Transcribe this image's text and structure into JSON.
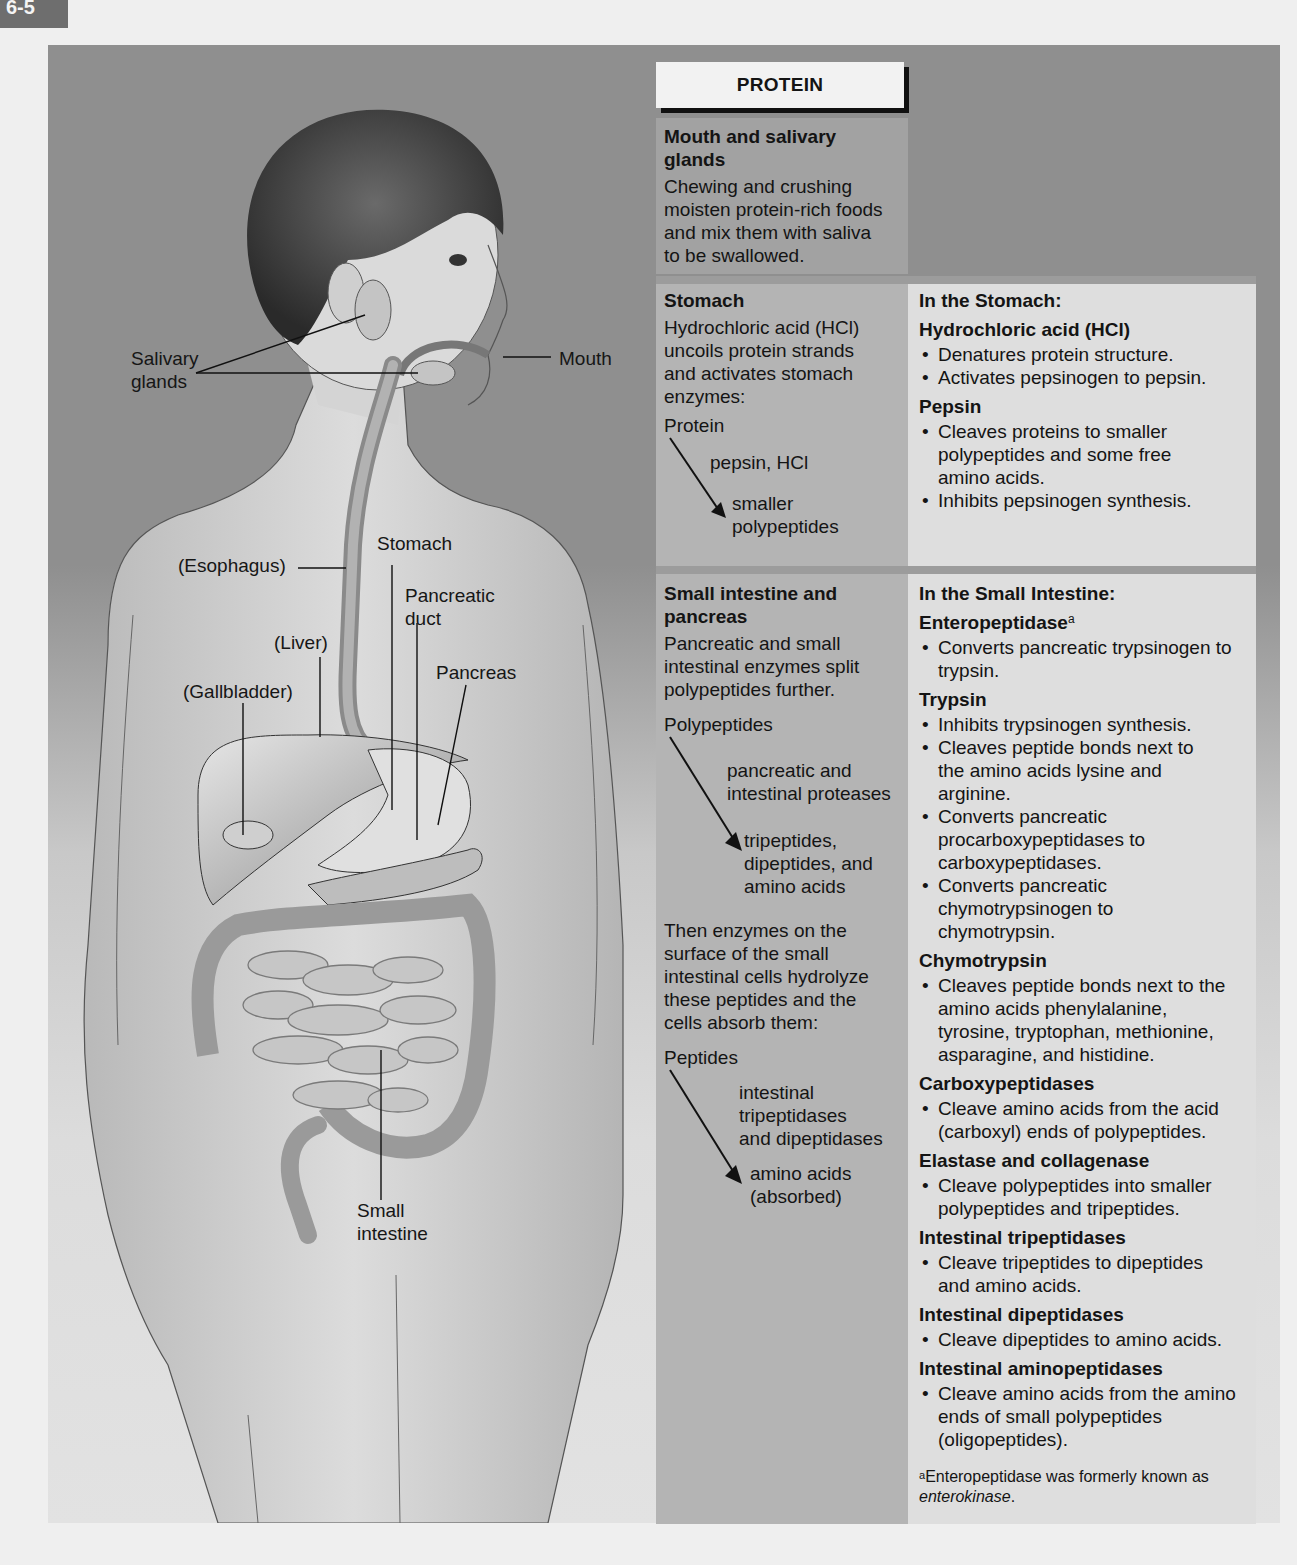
{
  "figure_tab": "6-5",
  "anatomy_labels": {
    "salivary_glands_1": "Salivary",
    "salivary_glands_2": "glands",
    "mouth": "Mouth",
    "esophagus": "(Esophagus)",
    "stomach": "Stomach",
    "pancreatic_duct_1": "Pancreatic",
    "pancreatic_duct_2": "duct",
    "liver": "(Liver)",
    "pancreas": "Pancreas",
    "gallbladder": "(Gallbladder)",
    "small_intestine_1": "Small",
    "small_intestine_2": "intestine"
  },
  "table": {
    "header": "PROTEIN",
    "mouth": {
      "title_1": "Mouth and salivary",
      "title_2": "glands",
      "text": "Chewing and crushing moisten protein-rich foods and mix them with saliva to be swallowed."
    },
    "stomach": {
      "title": "Stomach",
      "text": "Hydrochloric acid (HCl) uncoils protein strands and  activates stomach enzymes:",
      "flow": {
        "from": "Protein",
        "via": "pepsin, HCl",
        "to_1": "smaller",
        "to_2": "polypeptides"
      },
      "right_title": "In the Stomach:",
      "enzymes": [
        {
          "name": "Hydrochloric acid (HCl)",
          "bullets": [
            "Denatures protein structure.",
            "Activates pepsinogen to pepsin."
          ]
        },
        {
          "name": "Pepsin",
          "bullets": [
            "Cleaves proteins to smaller polypeptides and some free amino acids.",
            "Inhibits pepsinogen synthesis."
          ]
        }
      ]
    },
    "small_intestine": {
      "title_1": "Small intestine and",
      "title_2": "pancreas",
      "text": "Pancreatic and small intestinal enzymes split polypeptides further.",
      "flow1": {
        "from": "Polypeptides",
        "via_1": "pancreatic and",
        "via_2": "intestinal proteases",
        "to_1": "tripeptides,",
        "to_2": "dipeptides, and",
        "to_3": "amino acids"
      },
      "text2": "Then enzymes on the surface of the small intestinal cells hydrolyze these peptides and the cells absorb them:",
      "flow2": {
        "from": "Peptides",
        "via_1": "intestinal",
        "via_2": "tripeptidases",
        "via_3": "and dipeptidases",
        "to_1": "amino acids",
        "to_2": "(absorbed)"
      },
      "right_title": "In the Small Intestine:",
      "enzymes": [
        {
          "name": "Enteropeptidase",
          "sup": "a",
          "bullets": [
            "Converts pancreatic trypsinogen to trypsin."
          ]
        },
        {
          "name": "Trypsin",
          "bullets": [
            "Inhibits trypsinogen synthesis.",
            "Cleaves peptide bonds next to the amino acids lysine and arginine.",
            "Converts pancreatic procarboxypeptidases to carboxypeptidases.",
            "Converts pancreatic chymotrypsinogen to chymotrypsin."
          ]
        },
        {
          "name": "Chymotrypsin",
          "bullets": [
            "Cleaves peptide bonds next to the amino acids phenylalanine, tyrosine, tryptophan, methionine, asparagine, and histidine."
          ]
        },
        {
          "name": "Carboxypeptidases",
          "bullets": [
            "Cleave amino acids from the acid (carboxyl) ends of polypeptides."
          ]
        },
        {
          "name": "Elastase and collagenase",
          "bullets": [
            "Cleave polypeptides into smaller polypeptides and tripeptides."
          ]
        },
        {
          "name": "Intestinal tripeptidases",
          "bullets": [
            "Cleave tripeptides to dipeptides and amino acids."
          ]
        },
        {
          "name": "Intestinal dipeptidases",
          "bullets": [
            "Cleave dipeptides to amino acids."
          ]
        },
        {
          "name": "Intestinal aminopeptidases",
          "bullets": [
            "Cleave amino acids from the amino ends of small polypeptides (oligopeptides)."
          ]
        }
      ],
      "footnote": {
        "marker": "a",
        "text": "Enteropeptidase was formerly known as ",
        "italic": "enterokinase",
        "end": "."
      }
    }
  },
  "colors": {
    "panel_bg": "#8f8f8f",
    "left_cell": "#b4b4b4",
    "right_cell": "#dedede",
    "mouth_cell": "#a2a2a2",
    "header_bg": "#f2f2f2"
  }
}
